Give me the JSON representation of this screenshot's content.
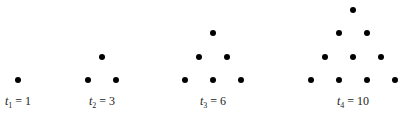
{
  "figure": {
    "groups": [
      {
        "var": "t",
        "sub": "1",
        "eq": " = 1",
        "label_x": 18,
        "dots": [
          [
            18,
            80
          ]
        ]
      },
      {
        "var": "t",
        "sub": "2",
        "eq": " = 3",
        "label_x": 102,
        "dots": [
          [
            102,
            57
          ],
          [
            88,
            80
          ],
          [
            116,
            80
          ]
        ]
      },
      {
        "var": "t",
        "sub": "3",
        "eq": " = 6",
        "label_x": 213,
        "dots": [
          [
            213,
            33
          ],
          [
            199,
            57
          ],
          [
            227,
            57
          ],
          [
            185,
            80
          ],
          [
            213,
            80
          ],
          [
            241,
            80
          ]
        ]
      },
      {
        "var": "t",
        "sub": "4",
        "eq": " = 10",
        "label_x": 353,
        "dots": [
          [
            353,
            10
          ],
          [
            339,
            33
          ],
          [
            367,
            33
          ],
          [
            325,
            57
          ],
          [
            353,
            57
          ],
          [
            381,
            57
          ],
          [
            311,
            80
          ],
          [
            339,
            80
          ],
          [
            367,
            80
          ],
          [
            395,
            80
          ]
        ]
      }
    ]
  }
}
